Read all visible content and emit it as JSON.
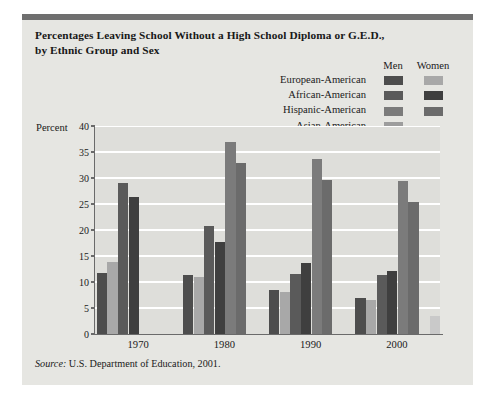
{
  "title_line1": "Percentages Leaving School Without a High School Diploma or G.E.D.,",
  "title_line2": "by Ethnic Group and Sex",
  "legend": {
    "col_men": "Men",
    "col_women": "Women",
    "rows": [
      {
        "label": "European-American",
        "men_color": "#4d4d4d",
        "women_color": "#a8a8a8"
      },
      {
        "label": "African-American",
        "men_color": "#5a5a5a",
        "women_color": "#3f3f3f"
      },
      {
        "label": "Hispanic-American",
        "men_color": "#7b7b7b",
        "women_color": "#6b6b6b"
      },
      {
        "label": "Asian-American",
        "men_color": "#9d9d9d",
        "women_color": "#c9c9c9"
      }
    ]
  },
  "source_prefix": "Source:",
  "source_text": " U.S. Department of Education, 2001.",
  "chart_data": {
    "type": "bar",
    "title": "Percentages Leaving School Without a High School Diploma or G.E.D., by Ethnic Group and Sex",
    "xlabel": "",
    "ylabel": "Percent",
    "ylim": [
      0,
      40
    ],
    "yticks": [
      0,
      5,
      10,
      15,
      20,
      25,
      30,
      35,
      40
    ],
    "grid": true,
    "legend_position": "top-right",
    "categories": [
      "1970",
      "1980",
      "1990",
      "2000"
    ],
    "series": [
      {
        "name": "European-American Men",
        "color": "#4d4d4d",
        "values": [
          11.7,
          11.4,
          8.4,
          6.9
        ]
      },
      {
        "name": "European-American Women",
        "color": "#a8a8a8",
        "values": [
          13.8,
          11.0,
          8.1,
          6.5
        ]
      },
      {
        "name": "African-American Men",
        "color": "#5a5a5a",
        "values": [
          29.0,
          20.7,
          11.6,
          11.3
        ]
      },
      {
        "name": "African-American Women",
        "color": "#3f3f3f",
        "values": [
          26.3,
          17.7,
          13.6,
          12.1
        ]
      },
      {
        "name": "Hispanic-American Men",
        "color": "#7b7b7b",
        "values": [
          0,
          37.0,
          33.6,
          29.5
        ]
      },
      {
        "name": "Hispanic-American Women",
        "color": "#6b6b6b",
        "values": [
          0,
          32.8,
          29.6,
          25.3
        ]
      },
      {
        "name": "Asian-American Men",
        "color": "#9d9d9d",
        "values": [
          0,
          0,
          0,
          0
        ]
      },
      {
        "name": "Asian-American Women",
        "color": "#c9c9c9",
        "values": [
          0,
          0,
          0,
          3.5
        ]
      }
    ]
  },
  "colors": {
    "figure_bg": "#e6e6e2",
    "plot_bg": "#dededa",
    "topbar": "#6f6f6f",
    "gridline": "#ffffff",
    "axis": "#6a6a6a"
  }
}
